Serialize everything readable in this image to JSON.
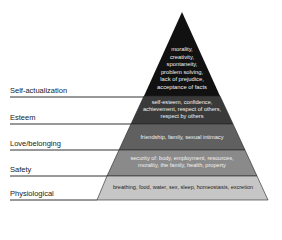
{
  "levels": [
    {
      "label": "Self-actualization",
      "description_lines": [
        "morality,",
        "creativity,",
        "spontaneity,",
        "problem solving,",
        "lack of prejudice,",
        "acceptance of facts"
      ],
      "color": "#111111"
    },
    {
      "label": "Esteem",
      "description_lines": [
        "self-esteem, confidence,",
        "achievement, respect of others,",
        "respect by others"
      ],
      "color": "#3a3a3a"
    },
    {
      "label": "Love/belonging",
      "description_lines": [
        "friendship, family, sexual intimacy"
      ],
      "color": "#5f5f5f"
    },
    {
      "label": "Safety",
      "description_lines": [
        "security of: body, employment, resources,",
        "morality, the family, health, property"
      ],
      "color": "#8a8a8a"
    },
    {
      "label": "Physiological",
      "description_lines": [
        "breathing, food, water, sex, sleep, homeostasis, excretion"
      ],
      "color": "#c4c4c4"
    }
  ]
}
